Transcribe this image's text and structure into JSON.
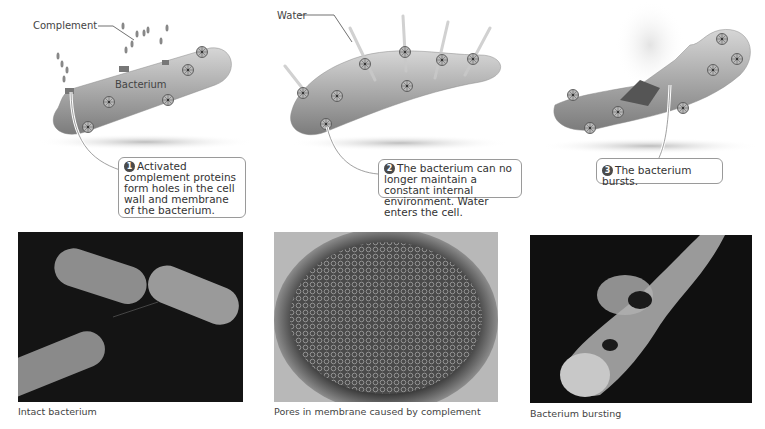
{
  "diagram": {
    "steps": [
      {
        "number": "1",
        "labels": {
          "complement": "Complement",
          "bacterium": "Bacterium"
        },
        "callout": "Activated complement proteins form holes in the cell wall and membrane of the bacterium."
      },
      {
        "number": "2",
        "labels": {
          "water": "Water"
        },
        "callout": "The bacterium can no longer maintain a constant internal environment. Water enters the cell."
      },
      {
        "number": "3",
        "callout": "The bacterium bursts."
      }
    ],
    "photos": [
      {
        "caption": "Intact bacterium"
      },
      {
        "caption": "Pores in membrane caused by complement"
      },
      {
        "caption": "Bacterium bursting"
      }
    ],
    "colors": {
      "bacterium_fill": "#9e9e9e",
      "bacterium_highlight": "#d0d0d0",
      "photo_bg_dark": "#111111",
      "badge": "#4a4a4a",
      "callout_border": "#9a9a9a"
    }
  }
}
